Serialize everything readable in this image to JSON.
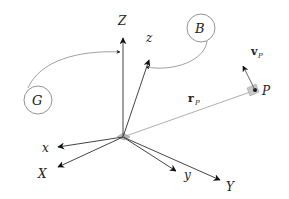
{
  "diagram": {
    "origin": {
      "x": 123,
      "y": 137
    },
    "global_frame": {
      "label": "G",
      "axes": [
        {
          "name": "X",
          "label": "X",
          "tip": [
            58,
            167
          ],
          "label_pos": [
            40,
            175
          ]
        },
        {
          "name": "Y",
          "label": "Y",
          "tip": [
            220,
            180
          ],
          "label_pos": [
            227,
            189
          ]
        },
        {
          "name": "Z",
          "label": "Z",
          "tip": [
            123,
            38
          ],
          "label_pos": [
            118,
            26
          ]
        }
      ]
    },
    "body_frame": {
      "label": "B",
      "axes": [
        {
          "name": "x",
          "label": "x",
          "tip": [
            58,
            147
          ],
          "label_pos": [
            42,
            153
          ]
        },
        {
          "name": "y",
          "label": "y",
          "tip": [
            176,
            171
          ],
          "label_pos": [
            184,
            179
          ]
        },
        {
          "name": "z",
          "label": "z",
          "tip": [
            149,
            60
          ],
          "label_pos": [
            146,
            44
          ]
        }
      ]
    },
    "point": {
      "label": "P",
      "pos": [
        255,
        90
      ]
    },
    "position_vector": {
      "label": "r",
      "subscript": "P"
    },
    "velocity_vector": {
      "label": "v",
      "subscript": "P"
    },
    "circles": [
      {
        "label": "G",
        "cx": 38,
        "cy": 100,
        "r": 14
      },
      {
        "label": "B",
        "cx": 201,
        "cy": 28,
        "r": 14
      }
    ],
    "colors": {
      "axis": "#333333",
      "thin": "#888888",
      "circle": "#777777",
      "plate": "#bbbbbb"
    }
  }
}
